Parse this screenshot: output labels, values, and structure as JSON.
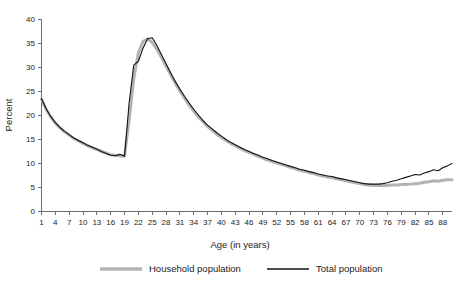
{
  "chart_data": {
    "type": "line",
    "title": "",
    "subtitle": "",
    "xlabel": "Age (in years)",
    "ylabel": "Percent",
    "xlim": [
      1,
      90
    ],
    "ylim": [
      0,
      40
    ],
    "ytick_step": 5,
    "xtick_step": 3,
    "grid": false,
    "legend_position": "bottom",
    "yticks": [
      0,
      5,
      10,
      15,
      20,
      25,
      30,
      35,
      40
    ],
    "ytick_labels": [
      "0",
      "5",
      "10",
      "15",
      "20",
      "25",
      "30",
      "35",
      "40"
    ],
    "xticks": [
      1,
      4,
      7,
      10,
      13,
      16,
      19,
      22,
      25,
      28,
      31,
      34,
      37,
      40,
      43,
      46,
      49,
      52,
      55,
      58,
      61,
      64,
      67,
      70,
      73,
      76,
      79,
      82,
      85,
      88
    ],
    "xtick_labels": [
      "1",
      "4",
      "7",
      "10",
      "13",
      "16",
      "19",
      "22",
      "25",
      "28",
      "31",
      "34",
      "37",
      "40",
      "43",
      "46",
      "49",
      "52",
      "55",
      "58",
      "61",
      "64",
      "67",
      "70",
      "73",
      "76",
      "79",
      "82",
      "85",
      "88"
    ],
    "x": [
      1,
      2,
      3,
      4,
      5,
      6,
      7,
      8,
      9,
      10,
      11,
      12,
      13,
      14,
      15,
      16,
      17,
      18,
      19,
      20,
      21,
      22,
      23,
      24,
      25,
      26,
      27,
      28,
      29,
      30,
      31,
      32,
      33,
      34,
      35,
      36,
      37,
      38,
      39,
      40,
      41,
      42,
      43,
      44,
      45,
      46,
      47,
      48,
      49,
      50,
      51,
      52,
      53,
      54,
      55,
      56,
      57,
      58,
      59,
      60,
      61,
      62,
      63,
      64,
      65,
      66,
      67,
      68,
      69,
      70,
      71,
      72,
      73,
      74,
      75,
      76,
      77,
      78,
      79,
      80,
      81,
      82,
      83,
      84,
      85,
      86,
      87,
      88,
      89,
      90
    ],
    "series": [
      {
        "name": "Household population",
        "color": "#b3b3b3",
        "line_width": 3.0,
        "values": [
          23.3,
          21.2,
          19.6,
          18.3,
          17.3,
          16.5,
          15.8,
          15.1,
          14.6,
          14.1,
          13.6,
          13.2,
          12.8,
          12.4,
          12.1,
          11.7,
          11.6,
          11.5,
          11.4,
          19.0,
          27.6,
          32.9,
          35.3,
          35.9,
          35.1,
          33.7,
          32.0,
          30.2,
          28.4,
          26.6,
          25.0,
          23.5,
          22.1,
          20.8,
          19.6,
          18.6,
          17.6,
          16.8,
          16.0,
          15.3,
          14.7,
          14.1,
          13.6,
          13.1,
          12.6,
          12.2,
          11.8,
          11.4,
          11.0,
          10.6,
          10.3,
          10.0,
          9.7,
          9.4,
          9.1,
          8.8,
          8.5,
          8.3,
          8.0,
          7.8,
          7.5,
          7.3,
          7.1,
          6.9,
          6.7,
          6.5,
          6.3,
          6.1,
          5.9,
          5.7,
          5.5,
          5.4,
          5.3,
          5.3,
          5.3,
          5.3,
          5.4,
          5.4,
          5.5,
          5.5,
          5.6,
          5.7,
          5.8,
          6.0,
          6.1,
          6.3,
          6.2,
          6.4,
          6.5,
          6.5
        ]
      },
      {
        "name": "Total population",
        "color": "#111111",
        "line_width": 1.1,
        "values": [
          23.4,
          21.3,
          19.7,
          18.4,
          17.4,
          16.6,
          15.9,
          15.2,
          14.7,
          14.2,
          13.7,
          13.3,
          12.9,
          12.4,
          12.0,
          11.6,
          11.5,
          11.8,
          11.4,
          22.5,
          30.4,
          31.2,
          33.9,
          35.9,
          36.1,
          34.5,
          32.6,
          30.7,
          28.8,
          27.0,
          25.4,
          23.9,
          22.5,
          21.2,
          20.0,
          18.9,
          17.9,
          17.1,
          16.3,
          15.6,
          14.9,
          14.3,
          13.8,
          13.3,
          12.8,
          12.4,
          12.0,
          11.6,
          11.2,
          10.9,
          10.5,
          10.2,
          9.9,
          9.6,
          9.3,
          9.0,
          8.7,
          8.5,
          8.2,
          8.0,
          7.7,
          7.5,
          7.3,
          7.2,
          6.9,
          6.7,
          6.5,
          6.3,
          6.1,
          5.9,
          5.7,
          5.6,
          5.6,
          5.6,
          5.7,
          5.9,
          6.2,
          6.4,
          6.7,
          7.0,
          7.3,
          7.6,
          7.5,
          7.9,
          8.2,
          8.6,
          8.4,
          9.0,
          9.4,
          9.9
        ]
      }
    ]
  },
  "legend": {
    "items": [
      {
        "label": "Household population",
        "color": "#b3b3b3",
        "line_width": 3.4
      },
      {
        "label": "Total population",
        "color": "#111111",
        "line_width": 1.3
      }
    ]
  }
}
